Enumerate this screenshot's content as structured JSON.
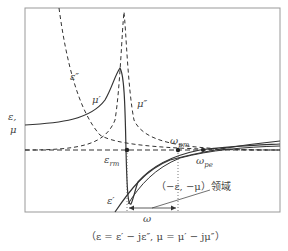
{
  "diagram": {
    "axis_label_y_line1": "ε,",
    "axis_label_y_line2": "μ",
    "curve_labels": {
      "eps_imag": "ε″",
      "mu_real": "μ′",
      "mu_imag": "μ″",
      "eps_real": "ε′"
    },
    "points": {
      "eps_rm": "ε",
      "eps_rm_sub": "rm",
      "omega_pm": "ω",
      "omega_pm_sub": "pm",
      "omega_pe": "ω",
      "omega_pe_sub": "pe"
    },
    "region_label": "（−ε, −μ）领域",
    "omega_label": "ω",
    "caption": "（ε = ε′ − jε″,  μ = μ′ − jμ″）"
  }
}
